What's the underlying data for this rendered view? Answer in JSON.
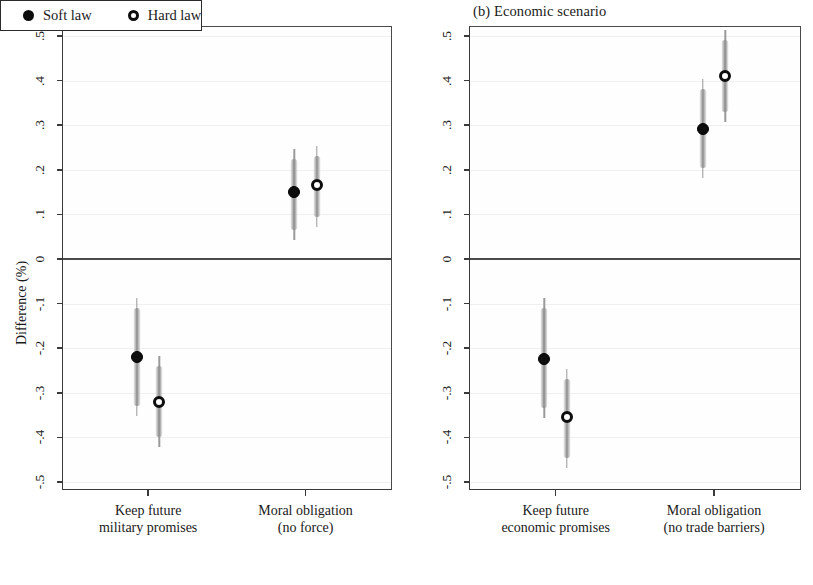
{
  "figure": {
    "background": "#ffffff",
    "marker_color_soft": "#0d0d0d",
    "marker_color_hard": "#ffffff",
    "ci_color": "#9a9a9a",
    "axis_color": "#3a3a3a"
  },
  "panels": [
    {
      "id": "a",
      "title": "(a) Security scenario",
      "ylabel": "Difference (%)",
      "yticks": [
        ".5",
        ".4",
        ".3",
        ".2",
        ".1",
        "0",
        "-.1",
        "-.2",
        "-.3",
        "-.4",
        "-.5"
      ],
      "categories": [
        {
          "line1": "Keep future",
          "line2": "military promises"
        },
        {
          "line1": "Moral obligation",
          "line2": "(no force)"
        }
      ],
      "legend": {
        "soft": "Soft law",
        "hard": "Hard law"
      }
    },
    {
      "id": "b",
      "title": "(b) Economic scenario",
      "ylabel": "Difference (%)",
      "yticks": [
        ".5",
        ".4",
        ".3",
        ".2",
        ".1",
        "0",
        "-.1",
        "-.2",
        "-.3",
        "-.4",
        "-.5"
      ],
      "categories": [
        {
          "line1": "Keep future",
          "line2": "economic promises"
        },
        {
          "line1": "Moral obligation",
          "line2": "(no trade barriers)"
        }
      ],
      "legend": {
        "soft": "Soft law",
        "hard": "Hard law"
      }
    }
  ],
  "chart_data": [
    {
      "type": "scatter",
      "panel": "a",
      "title": "(a) Security scenario",
      "xlabel": "",
      "ylabel": "Difference (%)",
      "ylim": [
        -0.52,
        0.52
      ],
      "yticks": [
        0.5,
        0.4,
        0.3,
        0.2,
        0.1,
        0,
        -0.1,
        -0.2,
        -0.3,
        -0.4,
        -0.5
      ],
      "grid": true,
      "reference_line": 0,
      "legend_position": "bottom",
      "categories": [
        "Keep future military promises",
        "Moral obligation (no force)"
      ],
      "series": [
        {
          "name": "Soft law",
          "marker": "filled-circle",
          "values": [
            -0.22,
            0.15
          ],
          "ci_low": [
            -0.33,
            0.065
          ],
          "ci_high": [
            -0.11,
            0.225
          ]
        },
        {
          "name": "Hard law",
          "marker": "hollow-circle",
          "values": [
            -0.32,
            0.165
          ],
          "ci_low": [
            -0.4,
            0.095
          ],
          "ci_high": [
            -0.24,
            0.23
          ]
        }
      ]
    },
    {
      "type": "scatter",
      "panel": "b",
      "title": "(b) Economic scenario",
      "xlabel": "",
      "ylabel": "Difference (%)",
      "ylim": [
        -0.52,
        0.52
      ],
      "yticks": [
        0.5,
        0.4,
        0.3,
        0.2,
        0.1,
        0,
        -0.1,
        -0.2,
        -0.3,
        -0.4,
        -0.5
      ],
      "grid": true,
      "reference_line": 0,
      "legend_position": "bottom",
      "categories": [
        "Keep future economic promises",
        "Moral obligation (no trade barriers)"
      ],
      "series": [
        {
          "name": "Soft law",
          "marker": "filled-circle",
          "values": [
            -0.225,
            0.292
          ],
          "ci_low": [
            -0.335,
            0.205
          ],
          "ci_high": [
            -0.11,
            0.38
          ]
        },
        {
          "name": "Hard law",
          "marker": "hollow-circle",
          "values": [
            -0.355,
            0.41
          ],
          "ci_low": [
            -0.445,
            0.33
          ],
          "ci_high": [
            -0.27,
            0.49
          ]
        }
      ]
    }
  ]
}
